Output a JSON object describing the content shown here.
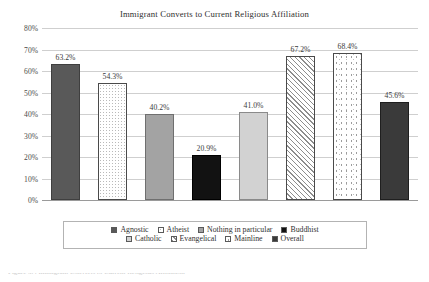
{
  "chart_data": {
    "type": "bar",
    "title": "Immigrant Converts to Current Religious Affiliation",
    "xlabel": "",
    "ylabel": "",
    "ylim": [
      0,
      80
    ],
    "grid": true,
    "legend_position": "bottom",
    "categories": [
      "Agnostic",
      "Atheist",
      "Nothing in particular",
      "Buddhist",
      "Catholic",
      "Evangelical",
      "Mainline",
      "Overall"
    ],
    "values": [
      63.2,
      54.3,
      40.2,
      20.9,
      41.0,
      67.2,
      68.4,
      45.6
    ],
    "value_labels": [
      "63.2%",
      "54.3%",
      "40.2%",
      "20.9%",
      "41.0%",
      "67.2%",
      "68.4%",
      "45.6%"
    ],
    "ytick_labels": [
      "80%",
      "70%",
      "60%",
      "50%",
      "40%",
      "30%",
      "20%",
      "10%",
      "0%"
    ],
    "ytick_values": [
      80,
      70,
      60,
      50,
      40,
      30,
      20,
      10,
      0
    ],
    "fills": [
      "solid-dark",
      "dots",
      "mid-gray",
      "black",
      "light-gray",
      "hatch",
      "speckle",
      "overall"
    ],
    "colors": {
      "solid_dark": "#595959",
      "black": "#121212",
      "mid_gray": "#a3a3a3",
      "light_gray": "#d2d2d2",
      "overall": "#3a3a3a",
      "pattern_background": "#ffffff",
      "pattern_ink": "#8d8d8d",
      "gridline": "#cfcfcf",
      "axis": "#9a9a9a",
      "text": "#2f2f2f"
    }
  },
  "legend": {
    "rows": [
      [
        {
          "label": "Agnostic",
          "fill": "solid-dark"
        },
        {
          "label": "Atheist",
          "fill": "dots"
        },
        {
          "label": "Nothing in particular",
          "fill": "mid-gray"
        },
        {
          "label": "Buddhist",
          "fill": "black"
        }
      ],
      [
        {
          "label": "Catholic",
          "fill": "light-gray"
        },
        {
          "label": "Evangelical",
          "fill": "hatch"
        },
        {
          "label": "Mainline",
          "fill": "speckle"
        },
        {
          "label": "Overall",
          "fill": "overall"
        }
      ]
    ]
  },
  "caption": {
    "cut_off_text": "Figure 3.4 Immigrant Converts to Current Religious Affiliation"
  }
}
